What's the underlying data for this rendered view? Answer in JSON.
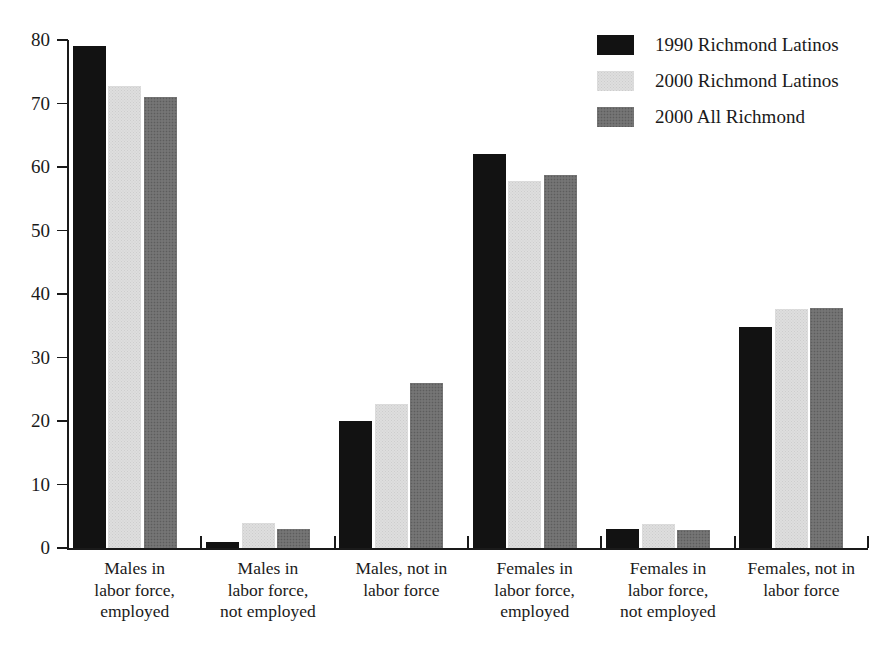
{
  "chart_data": {
    "type": "bar",
    "title": "",
    "subtitle": "",
    "xlabel": "",
    "ylabel": "",
    "ylim": [
      0,
      80
    ],
    "yticks": [
      0,
      10,
      20,
      30,
      40,
      50,
      60,
      70,
      80
    ],
    "ytick_labels": [
      "0",
      "10",
      "20",
      "30",
      "40",
      "50",
      "60",
      "70",
      "80"
    ],
    "grid": false,
    "legend_position": "top-right",
    "categories": [
      "Males in\nlabor force,\nemployed",
      "Males in\nlabor force,\nnot employed",
      "Males, not in\nlabor force",
      "Females in\nlabor force,\nemployed",
      "Females in\nlabor force,\nnot employed",
      "Females, not in\nlabor force"
    ],
    "category_lines": [
      [
        "Males in",
        "labor force,",
        "employed"
      ],
      [
        "Males in",
        "labor force,",
        "not employed"
      ],
      [
        "Males, not in",
        "labor force"
      ],
      [
        "Females in",
        "labor force,",
        "employed"
      ],
      [
        "Females in",
        "labor force,",
        "not employed"
      ],
      [
        "Females, not in",
        "labor force"
      ]
    ],
    "series": [
      {
        "name": "1990 Richmond Latinos",
        "color": "#121212",
        "values": [
          79,
          1,
          20,
          62,
          3,
          34.8
        ]
      },
      {
        "name": "2000 Richmond Latinos",
        "color": "#dedede",
        "values": [
          72.8,
          4,
          22.7,
          57.8,
          3.8,
          37.7
        ]
      },
      {
        "name": "2000 All Richmond",
        "color": "#6f6f6f",
        "values": [
          71,
          3,
          26,
          58.8,
          2.9,
          37.8
        ]
      }
    ]
  },
  "legend": {
    "items": [
      {
        "label": "1990 Richmond Latinos"
      },
      {
        "label": "2000 Richmond Latinos"
      },
      {
        "label": "2000 All Richmond"
      }
    ]
  }
}
